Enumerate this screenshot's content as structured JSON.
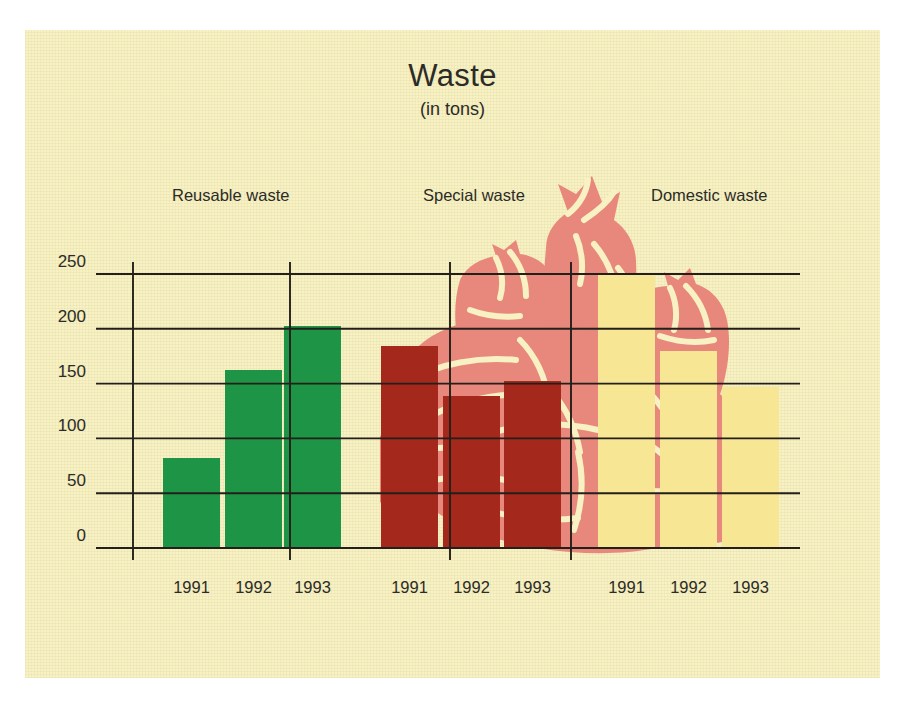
{
  "title": "Waste",
  "subtitle": "(in tons)",
  "colors": {
    "background": "#f7f1c3",
    "page": "#ffffff",
    "axis": "#231f1a",
    "text": "#2b2b28",
    "reusable": "#1e9447",
    "special": "#a5281c",
    "domestic": "#f7e693",
    "watermark": "#e8877c",
    "watermark_shade": "#dd7a72"
  },
  "watermark_name": "garbage-bags-illustration",
  "chart_data": {
    "type": "bar",
    "title": "Waste",
    "subtitle": "(in tons)",
    "xlabel": "",
    "ylabel": "",
    "ylim": [
      0,
      250
    ],
    "yticks": [
      0,
      50,
      100,
      150,
      200,
      250
    ],
    "grid": true,
    "legend_position": "above-groups",
    "categories": [
      "1991",
      "1992",
      "1993"
    ],
    "groups": [
      {
        "name": "Reusable waste",
        "color": "#1e9447",
        "categories": [
          "1991",
          "1992",
          "1993"
        ],
        "values": [
          82,
          162,
          203
        ]
      },
      {
        "name": "Special waste",
        "color": "#a5281c",
        "categories": [
          "1991",
          "1992",
          "1993"
        ],
        "values": [
          184,
          139,
          152
        ]
      },
      {
        "name": "Domestic waste",
        "color": "#f7e693",
        "categories": [
          "1991",
          "1992",
          "1993"
        ],
        "values": [
          251,
          180,
          147
        ]
      }
    ]
  }
}
